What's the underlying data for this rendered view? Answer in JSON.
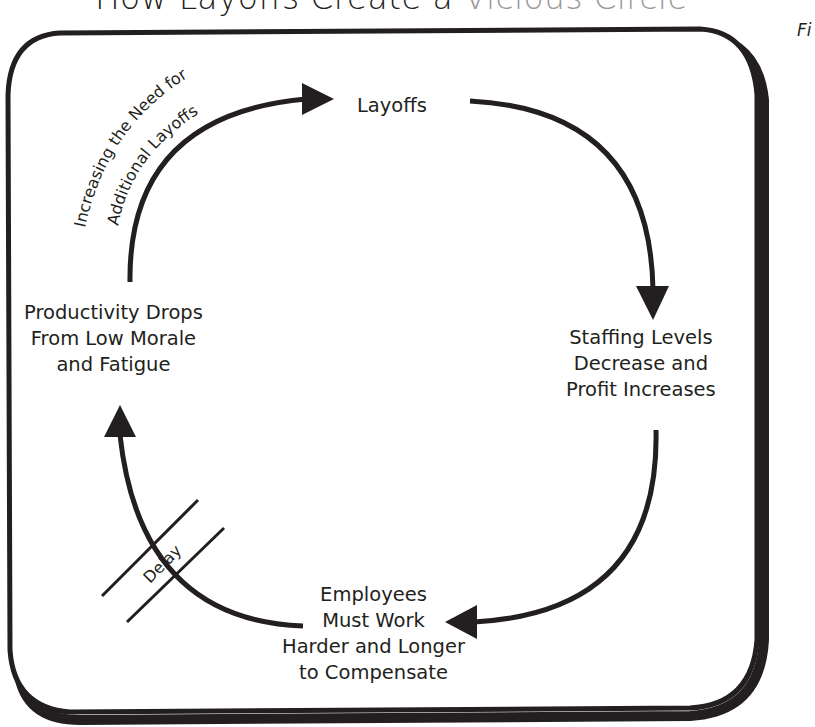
{
  "title": {
    "text": "How Layoffs Create a ",
    "faded_text": "Vicious Circle"
  },
  "figure_label": "Fi",
  "nodes": {
    "layoffs": {
      "lines": [
        "Layoffs"
      ]
    },
    "staffing": {
      "lines": [
        "Staffing Levels",
        "Decrease and",
        "Profit Increases"
      ]
    },
    "employees": {
      "lines": [
        "Employees",
        "Must Work",
        "Harder and Longer",
        "to Compensate"
      ]
    },
    "productivity": {
      "lines": [
        "Productivity Drops",
        "From Low Morale",
        "and Fatigue"
      ]
    }
  },
  "edge_labels": {
    "loop_label_line1": "Increasing the Need for",
    "loop_label_line2": "Additional Layoffs",
    "delay": "Delay"
  },
  "colors": {
    "ink": "#231f20",
    "background": "#ffffff",
    "faded": "#9a9a9a"
  }
}
